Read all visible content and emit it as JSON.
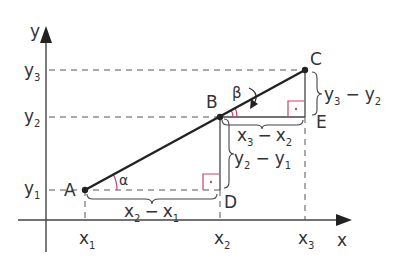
{
  "diagram": {
    "axes": {
      "x_label": "x",
      "y_label": "y"
    },
    "points": {
      "A": {
        "label": "A"
      },
      "B": {
        "label": "B"
      },
      "C": {
        "label": "C"
      },
      "D": {
        "label": "D"
      },
      "E": {
        "label": "E"
      }
    },
    "x_ticks": [
      {
        "base": "x",
        "sub": "1"
      },
      {
        "base": "x",
        "sub": "2"
      },
      {
        "base": "x",
        "sub": "3"
      }
    ],
    "y_ticks": [
      {
        "base": "y",
        "sub": "1"
      },
      {
        "base": "y",
        "sub": "2"
      },
      {
        "base": "y",
        "sub": "3"
      }
    ],
    "angles": {
      "alpha": "α",
      "beta": "β"
    },
    "differences": {
      "dx_AD": {
        "a": "x",
        "a_sub": "2",
        "op": "−",
        "b": "x",
        "b_sub": "1"
      },
      "dy_BD": {
        "a": "y",
        "a_sub": "2",
        "op": "−",
        "b": "y",
        "b_sub": "1"
      },
      "dx_BE": {
        "a": "x",
        "a_sub": "3",
        "op": "−",
        "b": "x",
        "b_sub": "2"
      },
      "dy_CE": {
        "a": "y",
        "a_sub": "3",
        "op": "−",
        "b": "y",
        "b_sub": "2"
      }
    },
    "colors": {
      "line": "#222222",
      "axis": "#444444",
      "dash": "#555555",
      "right_angle": "#d0406a",
      "text": "#333333"
    }
  }
}
